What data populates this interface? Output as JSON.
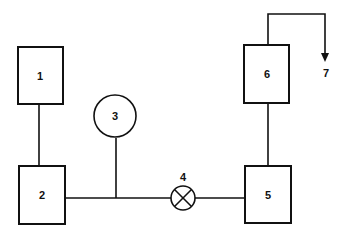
{
  "diagram": {
    "type": "process-flow",
    "nodes": [
      {
        "id": "1",
        "shape": "rectangle",
        "label": "1"
      },
      {
        "id": "2",
        "shape": "rectangle",
        "label": "2"
      },
      {
        "id": "3",
        "shape": "circle",
        "label": "3"
      },
      {
        "id": "4",
        "shape": "valve-x-circle",
        "label": "4"
      },
      {
        "id": "5",
        "shape": "rectangle",
        "label": "5"
      },
      {
        "id": "6",
        "shape": "rectangle",
        "label": "6"
      },
      {
        "id": "7",
        "shape": "arrow-terminal",
        "label": "7"
      }
    ],
    "edges": [
      {
        "from": "1",
        "to": "2"
      },
      {
        "from": "2",
        "to": "4"
      },
      {
        "from": "3",
        "to": "line-2-4"
      },
      {
        "from": "4",
        "to": "5"
      },
      {
        "from": "5",
        "to": "6"
      },
      {
        "from": "6",
        "to": "7",
        "arrow": true
      }
    ]
  },
  "labels": {
    "n1": "1",
    "n2": "2",
    "n3": "3",
    "n4": "4",
    "n5": "5",
    "n6": "6",
    "n7": "7"
  },
  "colors": {
    "stroke": "#111111",
    "background": "#ffffff"
  }
}
